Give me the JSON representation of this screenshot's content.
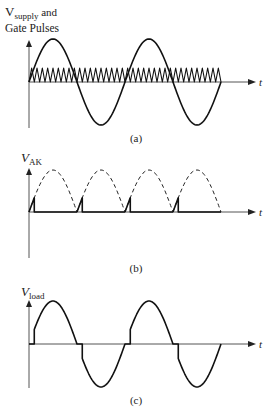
{
  "panels": [
    {
      "id": "a",
      "ylabel_main": "V",
      "ylabel_sub": "supply",
      "ylabel_suffix": " and",
      "ylabel_line2": "Gate Pulses",
      "xlabel": "t",
      "caption": "(a)",
      "cycles": 2,
      "gate_pulse_count": 36
    },
    {
      "id": "b",
      "ylabel_main": "V",
      "ylabel_sub": "AK",
      "xlabel": "t",
      "caption": "(b)",
      "half_cycles": 4,
      "firing_fraction": 0.11
    },
    {
      "id": "c",
      "ylabel_main": "V",
      "ylabel_sub": "load",
      "xlabel": "t",
      "caption": "(c)",
      "cycles": 2,
      "firing_fraction": 0.11
    }
  ]
}
